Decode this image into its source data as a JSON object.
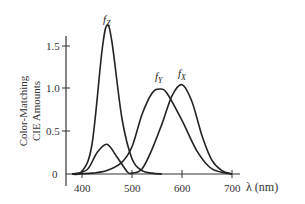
{
  "chart_data": {
    "type": "line",
    "title": "",
    "xlabel": "λ (nm)",
    "ylabel": "Color-Matching CIE Amounts",
    "ylabel_lines": [
      "Color-Matching",
      "CIE Amounts"
    ],
    "xlim": [
      370,
      740
    ],
    "ylim": [
      0,
      1.8
    ],
    "x_ticks": [
      400,
      500,
      600,
      700
    ],
    "y_ticks": [
      0,
      0.5,
      1.0,
      1.5
    ],
    "y_tick_labels": [
      "0",
      "0.5",
      "1.0",
      "1.5"
    ],
    "grid": false,
    "legend": "inline labels",
    "series": [
      {
        "name": "fZ",
        "label_main": "f",
        "label_sub": "Z",
        "peak_x": 450,
        "peak_y": 1.75,
        "x": [
          380,
          400,
          420,
          440,
          450,
          460,
          480,
          500,
          520,
          540,
          560
        ],
        "y": [
          0.0,
          0.03,
          0.35,
          1.45,
          1.75,
          1.55,
          0.65,
          0.18,
          0.04,
          0.01,
          0.0
        ]
      },
      {
        "name": "fY",
        "label_main": "f",
        "label_sub": "Y",
        "peak_x": 555,
        "peak_y": 1.0,
        "x": [
          380,
          420,
          450,
          480,
          500,
          520,
          540,
          555,
          570,
          600,
          630,
          660,
          700
        ],
        "y": [
          0.0,
          0.01,
          0.04,
          0.14,
          0.32,
          0.7,
          0.95,
          1.0,
          0.95,
          0.63,
          0.27,
          0.06,
          0.0
        ]
      },
      {
        "name": "fX",
        "label_main": "f",
        "label_sub": "X",
        "peak_x": 600,
        "peak_y": 1.05,
        "x": [
          380,
          410,
          430,
          450,
          470,
          490,
          500,
          520,
          540,
          560,
          580,
          600,
          620,
          640,
          660,
          680,
          700
        ],
        "y": [
          0.0,
          0.05,
          0.25,
          0.35,
          0.2,
          0.03,
          0.01,
          0.06,
          0.29,
          0.59,
          0.92,
          1.05,
          0.85,
          0.45,
          0.16,
          0.04,
          0.0
        ]
      }
    ]
  },
  "axes": {
    "x_tick_labels": [
      "400",
      "500",
      "600",
      "700"
    ],
    "y_tick_labels": [
      "0",
      "0.5",
      "1.0",
      "1.5"
    ],
    "xlabel": "λ (nm)",
    "ylabel_line1": "Color-Matching",
    "ylabel_line2": "CIE Amounts"
  },
  "labels": {
    "fz_main": "f",
    "fz_sub": "Z",
    "fy_main": "f",
    "fy_sub": "Y",
    "fx_main": "f",
    "fx_sub": "X"
  }
}
